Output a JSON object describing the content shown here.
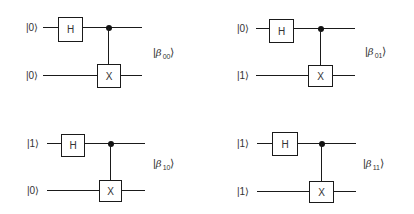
{
  "diagram": {
    "type": "quantum-circuits",
    "gate_labels": {
      "hadamard": "H",
      "not": "X"
    },
    "circuits": [
      {
        "id": "b00",
        "input_top": "|0⟩",
        "input_bottom": "|0⟩",
        "output_symbol": "β",
        "output_index": "00",
        "output_open": "|",
        "output_close": "⟩"
      },
      {
        "id": "b01",
        "input_top": "|0⟩",
        "input_bottom": "|1⟩",
        "output_symbol": "β",
        "output_index": "01",
        "output_open": "|",
        "output_close": "⟩"
      },
      {
        "id": "b10",
        "input_top": "|1⟩",
        "input_bottom": "|0⟩",
        "output_symbol": "β",
        "output_index": "10",
        "output_open": "|",
        "output_close": "⟩"
      },
      {
        "id": "b11",
        "input_top": "|1⟩",
        "input_bottom": "|1⟩",
        "output_symbol": "β",
        "output_index": "11",
        "output_open": "|",
        "output_close": "⟩"
      }
    ],
    "colors": {
      "line": "#1a1a1a",
      "text": "#333333",
      "background": "#ffffff"
    }
  }
}
